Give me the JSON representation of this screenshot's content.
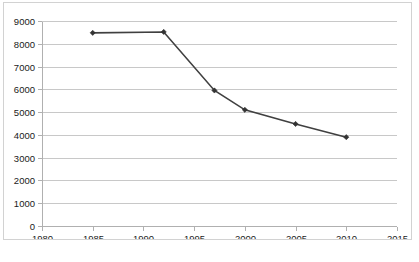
{
  "chart_data": {
    "type": "line",
    "title": "",
    "subtitle": "",
    "xlabel": "",
    "ylabel": "",
    "xlim": [
      1980,
      2015
    ],
    "ylim": [
      0,
      9000
    ],
    "grid": "horizontal",
    "legend": "none",
    "x_ticks": [
      1980,
      1985,
      1990,
      1995,
      2000,
      2005,
      2010,
      2015
    ],
    "y_ticks": [
      0,
      1000,
      2000,
      3000,
      4000,
      5000,
      6000,
      7000,
      8000,
      9000
    ],
    "x_tick_labels": [
      "1980",
      "1985",
      "1990",
      "1995",
      "2000",
      "2005",
      "2010",
      "2015"
    ],
    "y_tick_labels": [
      "0",
      "1000",
      "2000",
      "3000",
      "4000",
      "5000",
      "6000",
      "7000",
      "8000",
      "9000"
    ],
    "series": [
      {
        "name": "series-1",
        "color": "#404040",
        "marker": "diamond",
        "x": [
          1985,
          1992,
          1997,
          2000,
          2005,
          2010
        ],
        "values": [
          8480,
          8520,
          5950,
          5100,
          4480,
          3900
        ]
      }
    ]
  },
  "figure": {
    "background_color": "#ffffff",
    "border_color": "#d2d2d2",
    "gridline_color": "#c8c8c8",
    "axis_color": "#b0b0b0",
    "tick_label_color": "#1a1a1a"
  }
}
